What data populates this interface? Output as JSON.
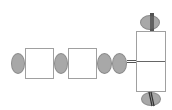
{
  "header": {
    "partial_text": ""
  },
  "diagram": {
    "type": "chain",
    "nodes": [
      {
        "id": "e1",
        "shape": "ellipse"
      },
      {
        "id": "b1",
        "shape": "rectangle"
      },
      {
        "id": "e2",
        "shape": "ellipse"
      },
      {
        "id": "b2",
        "shape": "rectangle"
      },
      {
        "id": "e3",
        "shape": "ellipse"
      },
      {
        "id": "e4",
        "shape": "ellipse"
      },
      {
        "id": "b3",
        "shape": "rectangle",
        "split": "horizontal"
      },
      {
        "id": "e5",
        "shape": "ellipse",
        "position": "top"
      },
      {
        "id": "e6",
        "shape": "ellipse",
        "position": "bottom"
      }
    ],
    "colors": {
      "ellipse_fill": "#a8a8a8",
      "box_border": "#a0a0a0",
      "connector": "#555555"
    }
  }
}
